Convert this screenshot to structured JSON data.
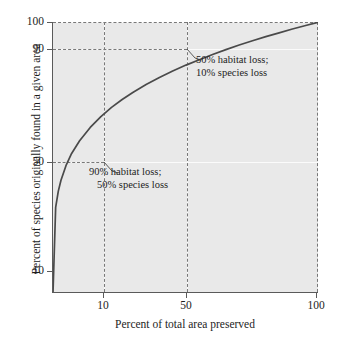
{
  "chart_data": {
    "type": "line",
    "title": "",
    "xlabel": "Percent of total area preserved",
    "ylabel": "Percent of species originally found in a given area",
    "xticks": [
      "10",
      "50",
      "100"
    ],
    "xtick_values": [
      10,
      50,
      100
    ],
    "yticks": [
      "10",
      "50",
      "90",
      "100"
    ],
    "ytick_values": [
      10,
      50,
      90,
      100
    ],
    "xlim": [
      0,
      100
    ],
    "ylim": [
      0,
      100
    ],
    "grid": true,
    "legend": "none",
    "series": [
      {
        "name": "Species-area curve (z = 0.25)",
        "x": [
          0,
          1,
          2,
          3,
          5,
          7,
          10,
          14,
          18,
          22,
          26,
          30,
          35,
          40,
          45,
          50,
          55,
          60,
          65,
          70,
          75,
          80,
          85,
          90,
          95,
          100
        ],
        "y": [
          0,
          31.6,
          37.6,
          41.6,
          47.3,
          51.5,
          56.2,
          61.1,
          65.1,
          68.5,
          71.4,
          74.0,
          76.9,
          79.5,
          81.9,
          84.1,
          86.1,
          88.0,
          89.8,
          91.5,
          93.1,
          94.6,
          96.0,
          97.4,
          98.7,
          100.0
        ]
      }
    ],
    "guides": [
      {
        "x": 10,
        "y": 50,
        "style": "dashed"
      },
      {
        "x": 50,
        "y": 90,
        "style": "dashed"
      },
      {
        "x": 100,
        "y": 100,
        "style": "dashed"
      }
    ],
    "annotations": [
      {
        "id": "upper",
        "at_x": 50,
        "at_y": 90,
        "line1": "50% habitat loss;",
        "line2": "10% species loss"
      },
      {
        "id": "lower",
        "at_x": 10,
        "at_y": 50,
        "line1": "90% habitat loss;",
        "line2": "50% species loss"
      }
    ],
    "colors": {
      "plot_background": "#e9e9e9",
      "gridline": "#fbfbfb",
      "curve": "#4a4a4a",
      "dashed_guide": "#787878",
      "axis": "#5a5a5a",
      "text": "#1d1d1d",
      "page_background": "#ffffff"
    }
  }
}
